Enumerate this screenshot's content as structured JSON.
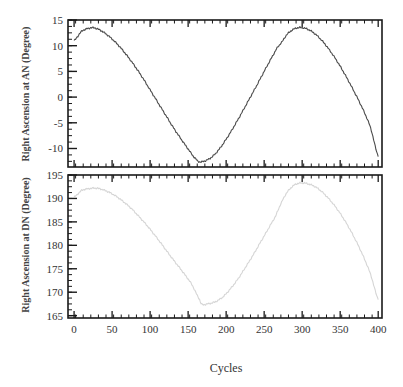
{
  "figure": {
    "background": "#ffffff",
    "width": 403,
    "height": 387
  },
  "labels": {
    "top_ylabel": "Right Ascension at AN (Degree)",
    "bottom_ylabel": "Right Ascension at DN (Degree)",
    "xlabel": "Cycles"
  },
  "chart_data": [
    {
      "type": "line",
      "title": "",
      "subtitle": "",
      "panel": "top",
      "xlabel": "",
      "ylabel": "Right Ascension at AN (Degree)",
      "xlim": [
        -8,
        405
      ],
      "ylim": [
        -13.6,
        15.0
      ],
      "grid": false,
      "legend": null,
      "color": "#4a4a4a",
      "line_width": 1.1,
      "xticks": [
        0,
        50,
        100,
        150,
        200,
        250,
        300,
        350,
        400
      ],
      "xticklabels": [
        "",
        "",
        "",
        "",
        "",
        "",
        "",
        "",
        ""
      ],
      "minor_xtick_step": 10,
      "yticks": [
        -10,
        -5,
        0,
        5,
        10,
        15
      ],
      "yticklabels": [
        "-10",
        "-5",
        "0",
        "5",
        "10",
        "15"
      ],
      "minor_ytick_step": 1.25,
      "annotations": [
        "first maximum approx +13.5 deg near cycle 25",
        "minimum approx -12.6 deg near cycle 165",
        "second maximum approx +13.5 deg near cycle 272",
        "ends near -11.5 deg at cycle 400"
      ],
      "x": [
        0,
        10,
        20,
        25,
        30,
        40,
        50,
        60,
        70,
        80,
        90,
        100,
        110,
        120,
        130,
        140,
        150,
        160,
        165,
        170,
        180,
        190,
        200,
        210,
        220,
        230,
        240,
        250,
        260,
        270,
        272,
        280,
        290,
        300,
        310,
        320,
        330,
        340,
        350,
        360,
        370,
        380,
        390,
        400
      ],
      "values": [
        11.0,
        12.8,
        13.4,
        13.5,
        13.3,
        12.5,
        11.3,
        9.8,
        8.0,
        6.0,
        3.8,
        1.4,
        -1.0,
        -3.4,
        -5.8,
        -8.0,
        -10.1,
        -12.0,
        -12.6,
        -12.5,
        -11.8,
        -10.3,
        -8.2,
        -5.8,
        -3.2,
        -0.5,
        2.2,
        5.0,
        7.7,
        10.1,
        10.5,
        12.2,
        13.3,
        13.5,
        13.0,
        11.9,
        10.3,
        8.3,
        6.0,
        3.4,
        0.6,
        -2.4,
        -6.0,
        -11.4
      ]
    },
    {
      "type": "line",
      "title": "",
      "subtitle": "",
      "panel": "bottom",
      "xlabel": "Cycles",
      "ylabel": "Right Ascension at DN (Degree)",
      "xlim": [
        -8,
        405
      ],
      "ylim": [
        164.5,
        195.0
      ],
      "grid": false,
      "legend": null,
      "color": "#d5d5d5",
      "line_width": 1.1,
      "xticks": [
        0,
        50,
        100,
        150,
        200,
        250,
        300,
        350,
        400
      ],
      "xticklabels": [
        "0",
        "50",
        "100",
        "150",
        "200",
        "250",
        "300",
        "350",
        "400"
      ],
      "minor_xtick_step": 10,
      "yticks": [
        165,
        170,
        175,
        180,
        185,
        190,
        195
      ],
      "yticklabels": [
        "165",
        "170",
        "175",
        "180",
        "185",
        "190",
        "195"
      ],
      "minor_ytick_step": 1.25,
      "annotations": [
        "first maximum approx 192.2 deg near cycle 28",
        "minimum approx 167.4 deg near cycle 168",
        "second maximum approx 193.3 deg near cycle 272",
        "ends near 168.5 deg at cycle 400"
      ],
      "x": [
        0,
        10,
        20,
        28,
        35,
        45,
        55,
        65,
        75,
        85,
        95,
        105,
        115,
        125,
        135,
        145,
        155,
        165,
        168,
        175,
        185,
        195,
        205,
        215,
        225,
        235,
        245,
        255,
        265,
        272,
        280,
        290,
        300,
        310,
        320,
        330,
        340,
        350,
        360,
        370,
        380,
        390,
        400
      ],
      "values": [
        190.3,
        191.7,
        192.1,
        192.2,
        192.0,
        191.4,
        190.5,
        189.3,
        187.9,
        186.2,
        184.4,
        182.4,
        180.3,
        178.1,
        176.0,
        173.9,
        171.6,
        168.5,
        167.4,
        167.5,
        167.9,
        168.9,
        170.6,
        172.7,
        175.2,
        177.8,
        180.6,
        183.4,
        186.2,
        188.9,
        191.3,
        192.9,
        193.3,
        193.0,
        192.2,
        190.8,
        189.0,
        186.8,
        184.2,
        181.2,
        177.8,
        173.8,
        168.6
      ]
    }
  ]
}
